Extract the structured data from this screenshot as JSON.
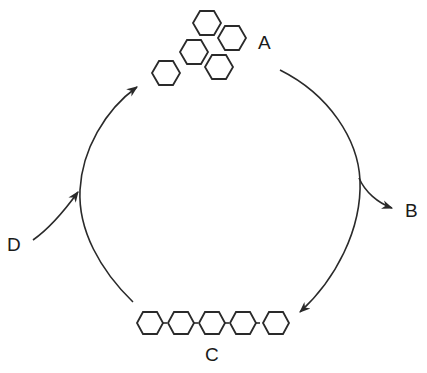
{
  "diagram": {
    "type": "cycle",
    "labels": {
      "A": "A",
      "B": "B",
      "C": "C",
      "D": "D"
    },
    "nodes": [
      {
        "id": "A",
        "description": "cluster of separate hexagon units",
        "hexagon_count": 5
      },
      {
        "id": "C",
        "description": "chain of linked hexagon units",
        "hexagon_count": 5
      }
    ],
    "arrows": [
      {
        "from": "A",
        "to": "C",
        "direction": "clockwise, right side"
      },
      {
        "from": "right arc",
        "to": "B",
        "description": "branch leaving the cycle"
      },
      {
        "from": "C",
        "to": "A",
        "direction": "clockwise, left side"
      },
      {
        "from": "D",
        "to": "left arc",
        "description": "input entering the cycle"
      }
    ],
    "colors": {
      "line": "#2a2a2a",
      "background": "#ffffff"
    }
  }
}
